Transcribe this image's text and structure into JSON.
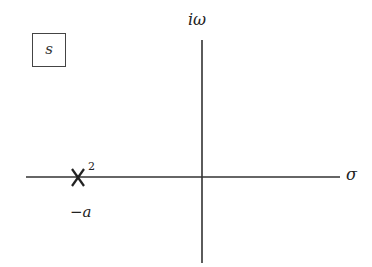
{
  "plane": {
    "label": "s"
  },
  "axes": {
    "imag_label": "iω",
    "real_label": "σ"
  },
  "pole": {
    "marker": "X",
    "multiplicity": "2",
    "location_label": "−a"
  }
}
